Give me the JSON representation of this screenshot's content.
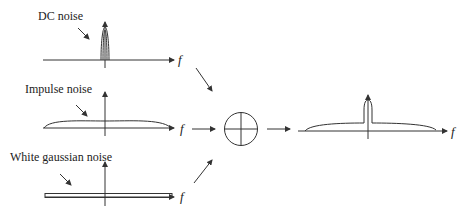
{
  "diagram": {
    "inputs": [
      {
        "label": "DC noise",
        "axis_label": "f",
        "shape": "narrow-spike-at-zero"
      },
      {
        "label": "Impulse noise",
        "axis_label": "f",
        "shape": "broad-low-arc"
      },
      {
        "label": "White gaussian noise",
        "axis_label": "f",
        "shape": "flat-band"
      }
    ],
    "combiner": {
      "symbol": "summing-junction",
      "icon": "circle-plus-icon"
    },
    "output": {
      "axis_label": "f",
      "shape": "broad-arc-with-center-spike"
    },
    "colors": {
      "line": "#333333",
      "text": "#222222",
      "background": "#ffffff"
    }
  }
}
